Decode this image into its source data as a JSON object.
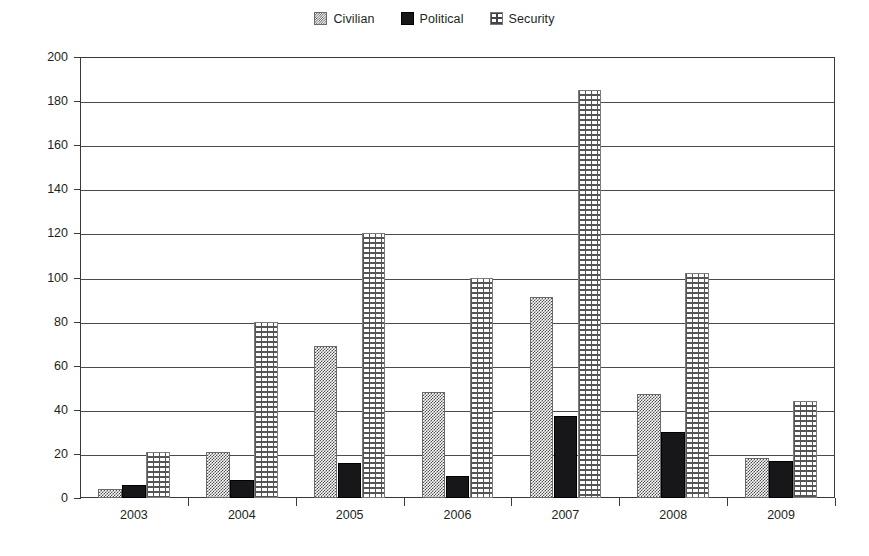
{
  "chart_data": {
    "type": "bar",
    "title": "",
    "xlabel": "",
    "ylabel": "",
    "categories": [
      "2003",
      "2004",
      "2005",
      "2006",
      "2007",
      "2008",
      "2009"
    ],
    "series": [
      {
        "name": "Civilian",
        "pattern": "fine-checker-gray",
        "values": [
          4,
          21,
          69,
          48,
          91,
          47,
          18
        ]
      },
      {
        "name": "Political",
        "pattern": "solid-black",
        "values": [
          6,
          8,
          16,
          10,
          37,
          30,
          17
        ]
      },
      {
        "name": "Security",
        "pattern": "brick-weave",
        "values": [
          21,
          80,
          120,
          100,
          185,
          102,
          44
        ]
      }
    ],
    "ylim": [
      0,
      200
    ],
    "ytick_step": 20,
    "yticks": [
      0,
      20,
      40,
      60,
      80,
      100,
      120,
      140,
      160,
      180,
      200
    ],
    "grid": "horizontal",
    "legend_position": "top-center",
    "colors": {
      "civilian": "#4c4c4c",
      "political": "#17171a",
      "security": "#555555",
      "axis": "#3a3a3a",
      "gridline": "#4a4a4a",
      "text": "#231f20",
      "background": "#ffffff"
    }
  },
  "legend": {
    "entries": [
      {
        "label": "Civilian",
        "icon": "checker-swatch-icon"
      },
      {
        "label": "Political",
        "icon": "solid-swatch-icon"
      },
      {
        "label": "Security",
        "icon": "brick-swatch-icon"
      }
    ]
  }
}
